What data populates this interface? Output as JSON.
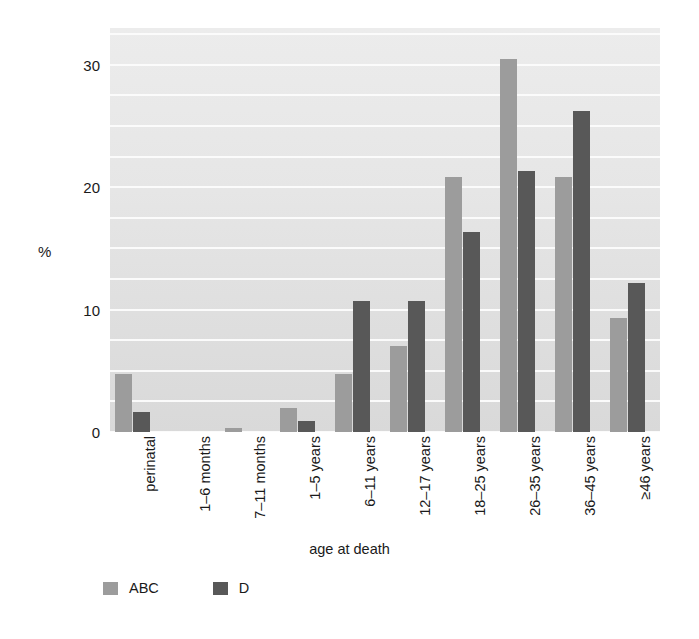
{
  "chart_data": {
    "type": "bar",
    "title": "",
    "xlabel": "age at death",
    "ylabel": "%",
    "ylim": [
      0,
      33
    ],
    "yticks": [
      0,
      10,
      20,
      30
    ],
    "gridlines": [
      0,
      2.5,
      5,
      7.5,
      10,
      12.5,
      15,
      17.5,
      20,
      22.5,
      25,
      27.5,
      30,
      32.5
    ],
    "grid": true,
    "legend_position": "bottom-left",
    "categories": [
      "perinatal",
      "1–6 months",
      "7–11 months",
      "1–5 years",
      "6–11 years",
      "12–17 years",
      "18–25 years",
      "26–35 years",
      "36–45 years",
      "≥46 years"
    ],
    "series": [
      {
        "name": "ABC",
        "color": "#9c9c9c",
        "values": [
          4.7,
          0.0,
          0.3,
          2.0,
          4.7,
          7.0,
          20.8,
          30.5,
          20.8,
          9.3
        ]
      },
      {
        "name": "D",
        "color": "#585858",
        "values": [
          1.6,
          0.0,
          0.0,
          0.9,
          10.7,
          10.7,
          16.3,
          21.3,
          26.2,
          12.2
        ]
      }
    ]
  },
  "legend": {
    "items": [
      {
        "label": "ABC",
        "color": "#9c9c9c"
      },
      {
        "label": "D",
        "color": "#585858"
      }
    ]
  },
  "axes": {
    "y_label": "%",
    "x_label": "age at death",
    "y_tick_labels": [
      "0",
      "10",
      "20",
      "30"
    ]
  },
  "colors": {
    "plot_background": "#e3e3e3",
    "gridline": "#fbfbfb",
    "page_background": "#ffffff",
    "text": "#1a1a1a"
  }
}
